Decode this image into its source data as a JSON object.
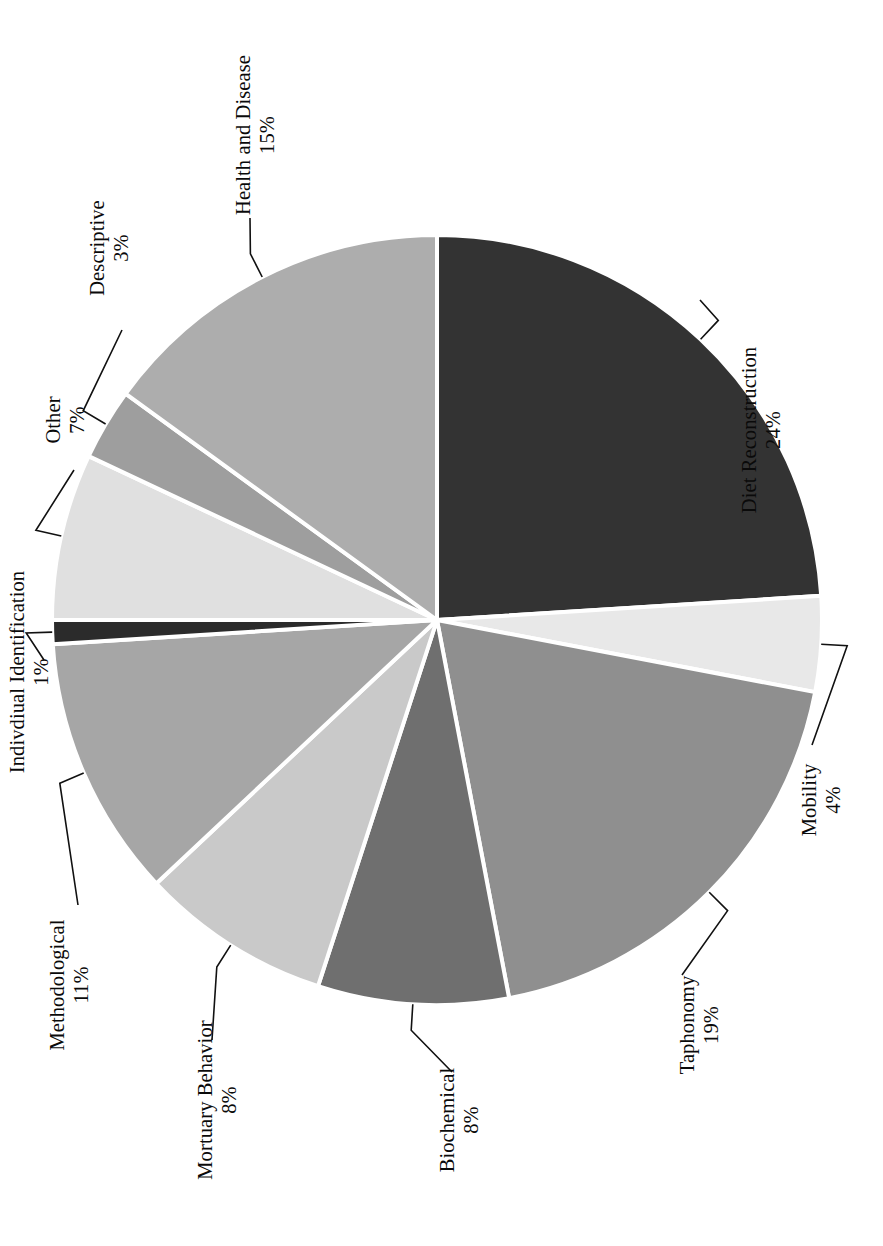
{
  "figure": {
    "orientation": "rotated-90-ccw",
    "background": "#ffffff",
    "line_color": "#111111",
    "slice_divider_color": "#ffffff"
  },
  "chart_data": {
    "type": "pie",
    "title": "",
    "subtitle": "",
    "xlabel": "",
    "ylabel": "",
    "legend_position": "none",
    "labels_position": "outside-with-leader-lines",
    "grid": false,
    "total_percent": 100,
    "categories": [
      "Diet Reconstruction",
      "Mobility",
      "Taphonomy",
      "Biochemical",
      "Mortuary Behavior",
      "Methodological",
      "Indivdiual Identification",
      "Other",
      "Descriptive",
      "Health and Disease"
    ],
    "values": [
      24,
      4,
      19,
      8,
      8,
      11,
      1,
      7,
      3,
      15
    ],
    "value_labels": [
      "24%",
      "4%",
      "19%",
      "8%",
      "8%",
      "11%",
      "1%",
      "7%",
      "3%",
      "15%"
    ],
    "colors": [
      "#333333",
      "#e8e8e8",
      "#8f8f8f",
      "#6f6f6f",
      "#c9c9c9",
      "#a6a6a6",
      "#2b2b2b",
      "#e0e0e0",
      "#9e9e9e",
      "#adadad"
    ],
    "slices": [
      {
        "label": "Diet Reconstruction",
        "value": 24,
        "value_label": "24%",
        "color": "#333333"
      },
      {
        "label": "Mobility",
        "value": 4,
        "value_label": "4%",
        "color": "#e8e8e8"
      },
      {
        "label": "Taphonomy",
        "value": 19,
        "value_label": "19%",
        "color": "#8f8f8f"
      },
      {
        "label": "Biochemical",
        "value": 8,
        "value_label": "8%",
        "color": "#6f6f6f"
      },
      {
        "label": "Mortuary Behavior",
        "value": 8,
        "value_label": "8%",
        "color": "#c9c9c9"
      },
      {
        "label": "Methodological",
        "value": 11,
        "value_label": "11%",
        "color": "#a6a6a6"
      },
      {
        "label": "Indivdiual Identification",
        "value": 1,
        "value_label": "1%",
        "color": "#2b2b2b"
      },
      {
        "label": "Other",
        "value": 7,
        "value_label": "7%",
        "color": "#e0e0e0"
      },
      {
        "label": "Descriptive",
        "value": 3,
        "value_label": "3%",
        "color": "#9e9e9e"
      },
      {
        "label": "Health and Disease",
        "value": 15,
        "value_label": "15%",
        "color": "#adadad"
      }
    ]
  },
  "callouts": [
    {
      "name": "diet-reconstruction",
      "label": "Diet Reconstruction",
      "percent": "24%"
    },
    {
      "name": "mobility",
      "label": "Mobility",
      "percent": "4%"
    },
    {
      "name": "taphonomy",
      "label": "Taphonomy",
      "percent": "19%"
    },
    {
      "name": "biochemical",
      "label": "Biochemical",
      "percent": "8%"
    },
    {
      "name": "mortuary-behavior",
      "label": "Mortuary Behavior",
      "percent": "8%"
    },
    {
      "name": "methodological",
      "label": "Methodological",
      "percent": "11%"
    },
    {
      "name": "individual-identification",
      "label": "Indivdiual Identification",
      "percent": "1%"
    },
    {
      "name": "other",
      "label": "Other",
      "percent": "7%"
    },
    {
      "name": "descriptive",
      "label": "Descriptive",
      "percent": "3%"
    },
    {
      "name": "health-and-disease",
      "label": "Health and Disease",
      "percent": "15%"
    }
  ]
}
